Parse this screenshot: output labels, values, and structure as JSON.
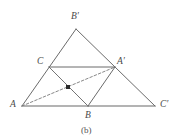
{
  "figure": {
    "caption": "(b)",
    "caption_pos": {
      "x": 81,
      "y": 126
    },
    "background_color": "#ffffff",
    "stroke_color": "#6b6b6b",
    "base_stroke_color": "#9a9a9a",
    "dashed_stroke_color": "#7a7a7a",
    "marker_color": "#2b2b2b",
    "label_color": "#4a4a4a",
    "width": 179,
    "height": 140
  },
  "points": [
    {
      "id": "A",
      "label": "A",
      "x": 22,
      "y": 106,
      "label_x": 10,
      "label_y": 100
    },
    {
      "id": "B",
      "label": "B",
      "x": 88,
      "y": 106,
      "label_x": 85,
      "label_y": 111
    },
    {
      "id": "Cprime",
      "label": "C′",
      "x": 155,
      "y": 106,
      "label_x": 160,
      "label_y": 100
    },
    {
      "id": "C",
      "label": "C",
      "x": 49,
      "y": 67,
      "label_x": 37,
      "label_y": 57
    },
    {
      "id": "Aprime",
      "label": "A′",
      "x": 115,
      "y": 67,
      "label_x": 117,
      "label_y": 57
    },
    {
      "id": "Bprime",
      "label": "B′",
      "x": 76,
      "y": 29,
      "label_x": 71,
      "label_y": 12
    }
  ],
  "centroid_marker": {
    "label": "centroid",
    "x": 68,
    "y": 87,
    "size": 4
  },
  "solid_segments": [
    {
      "name": "side-A-Bprime",
      "from": "A",
      "to": "Bprime"
    },
    {
      "name": "side-Bprime-Cprime",
      "from": "Bprime",
      "to": "Cprime"
    },
    {
      "name": "side-C-Aprime",
      "from": "C",
      "to": "Aprime"
    },
    {
      "name": "side-C-B",
      "from": "C",
      "to": "B"
    },
    {
      "name": "side-B-Aprime",
      "from": "B",
      "to": "Aprime"
    }
  ],
  "base_segments": [
    {
      "name": "base-A-B",
      "from": "A",
      "to": "B"
    },
    {
      "name": "base-B-Cprime",
      "from": "B",
      "to": "Cprime"
    }
  ],
  "dashed_segments": [
    {
      "name": "median-A-Aprime",
      "from": "A",
      "to": "Aprime"
    },
    {
      "name": "median-B-C",
      "from": "B",
      "to": "C"
    }
  ]
}
